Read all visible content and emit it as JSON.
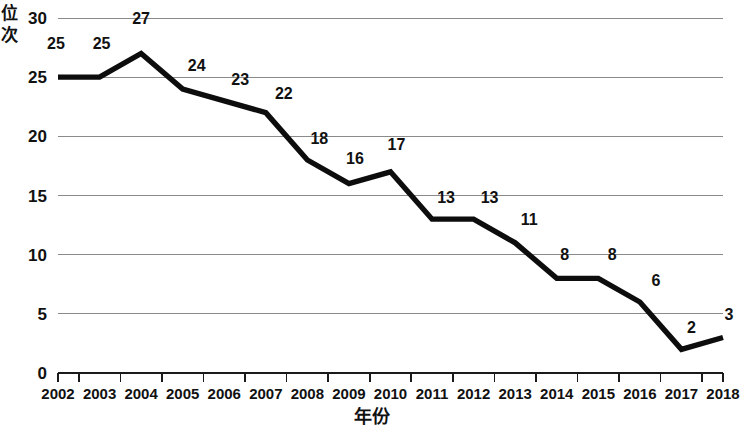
{
  "chart_data": {
    "type": "line",
    "title": "",
    "xlabel": "年份",
    "ylabel": "位次",
    "categories": [
      "2002",
      "2003",
      "2004",
      "2005",
      "2006",
      "2007",
      "2008",
      "2009",
      "2010",
      "2011",
      "2012",
      "2013",
      "2014",
      "2015",
      "2016",
      "2017",
      "2018"
    ],
    "values": [
      25,
      25,
      27,
      24,
      23,
      22,
      18,
      16,
      17,
      13,
      13,
      11,
      8,
      8,
      6,
      2,
      3
    ],
    "series": [
      {
        "name": "位次",
        "values": [
          25,
          25,
          27,
          24,
          23,
          22,
          18,
          16,
          17,
          13,
          13,
          11,
          8,
          8,
          6,
          2,
          3
        ]
      }
    ],
    "point_labels": [
      "25",
      "25",
      "27",
      "24",
      "23",
      "22",
      "18",
      "16",
      "17",
      "13",
      "13",
      "11",
      "8",
      "8",
      "6",
      "2",
      "3"
    ],
    "ylim": [
      0,
      30
    ],
    "yticks": [
      "0",
      "5",
      "10",
      "15",
      "20",
      "25",
      "30"
    ],
    "grid": "horizontal",
    "legend": "none",
    "line_color": "#0d0d0d",
    "grid_color": "#8a8a8a",
    "axis_color": "#1a1a1a"
  },
  "axes": {
    "y_title_chars": [
      "位",
      "次"
    ],
    "x_title": "年份"
  }
}
